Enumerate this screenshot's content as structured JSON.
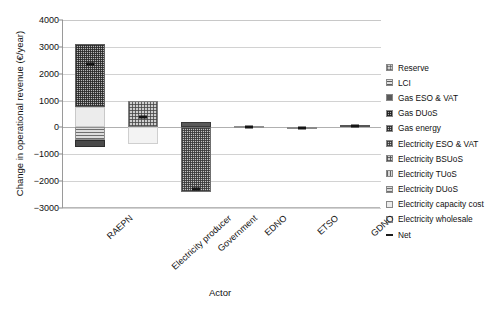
{
  "chart_data": {
    "type": "bar",
    "title": "",
    "xlabel": "Actor",
    "ylabel": "Change in operational revenue (€/year)",
    "ylim": [
      -3000,
      4000
    ],
    "ytick_step": 1000,
    "yticks": [
      "4000",
      "3000",
      "2000",
      "1000",
      "0",
      "−1000",
      "−2000",
      "−3000"
    ],
    "grid": true,
    "stacked": true,
    "legend_position": "right",
    "categories": [
      "RAEPN",
      "Electricity producer",
      "Government",
      "EDNO",
      "ETSO",
      "GDNO"
    ],
    "series": [
      {
        "name": "Reserve",
        "values": [
          0,
          0,
          0,
          0,
          0,
          0
        ]
      },
      {
        "name": "LCI",
        "values": [
          0,
          0,
          0,
          0,
          0,
          0
        ]
      },
      {
        "name": "Gas ESO & VAT",
        "values": [
          0,
          0,
          210,
          0,
          0,
          0
        ]
      },
      {
        "name": "Gas DUoS",
        "values": [
          0,
          0,
          0,
          0,
          0,
          60
        ]
      },
      {
        "name": "Gas energy",
        "values": [
          2350,
          0,
          0,
          0,
          0,
          0
        ]
      },
      {
        "name": "Electricity ESO & VAT",
        "values": [
          -250,
          0,
          -2400,
          0,
          0,
          0
        ]
      },
      {
        "name": "Electricity BSUoS",
        "values": [
          0,
          0,
          0,
          0,
          -20,
          0
        ]
      },
      {
        "name": "Electricity TUoS",
        "values": [
          0,
          0,
          0,
          0,
          0,
          0
        ]
      },
      {
        "name": "Electricity DUoS",
        "values": [
          -480,
          990,
          0,
          40,
          0,
          0
        ]
      },
      {
        "name": "Electricity capacity cost",
        "values": [
          750,
          0,
          0,
          0,
          0,
          0
        ]
      },
      {
        "name": "Electricity wholesale",
        "values": [
          0,
          -600,
          0,
          0,
          0,
          0
        ]
      },
      {
        "name": "Net",
        "values": [
          2380,
          370,
          -2280,
          30,
          -25,
          65
        ]
      }
    ],
    "net_marker_label": "Net",
    "bars": [
      {
        "category": "RAEPN",
        "positive_total": 3100,
        "negative_total": -730,
        "net": 2380,
        "segments": [
          {
            "series": "Electricity capacity cost",
            "from": 0,
            "to": 750,
            "pattern": "p-capacity"
          },
          {
            "series": "Gas energy",
            "from": 750,
            "to": 3100,
            "pattern": "p-gasenergy"
          },
          {
            "series": "Electricity DUoS",
            "from": 0,
            "to": -480,
            "pattern": "p-eduos"
          },
          {
            "series": "Electricity ESO & VAT",
            "from": -480,
            "to": -730,
            "pattern": "p-dark"
          }
        ]
      },
      {
        "category": "Electricity producer",
        "positive_total": 990,
        "negative_total": -600,
        "net": 370,
        "segments": [
          {
            "series": "Electricity DUoS",
            "from": 0,
            "to": 990,
            "pattern": "p-ebsuos"
          },
          {
            "series": "Electricity wholesale",
            "from": 0,
            "to": -600,
            "pattern": "p-wholesale"
          }
        ]
      },
      {
        "category": "Government",
        "positive_total": 210,
        "negative_total": -2400,
        "net": -2280,
        "segments": [
          {
            "series": "Gas ESO & VAT",
            "from": 0,
            "to": 210,
            "pattern": "p-gaseso"
          },
          {
            "series": "Electricity ESO & VAT",
            "from": 0,
            "to": -2400,
            "pattern": "p-eeso"
          }
        ]
      },
      {
        "category": "EDNO",
        "positive_total": 40,
        "negative_total": 0,
        "net": 30,
        "segments": [
          {
            "series": "Electricity DUoS",
            "from": 0,
            "to": 40,
            "pattern": "p-eduos"
          }
        ]
      },
      {
        "category": "ETSO",
        "positive_total": 0,
        "negative_total": -20,
        "net": -25,
        "segments": [
          {
            "series": "Electricity BSUoS",
            "from": 0,
            "to": -20,
            "pattern": "p-etuos"
          }
        ]
      },
      {
        "category": "GDNO",
        "positive_total": 95,
        "negative_total": 0,
        "net": 65,
        "segments": [
          {
            "series": "Gas DUoS",
            "from": 0,
            "to": 95,
            "pattern": "p-gasduos"
          }
        ]
      }
    ],
    "legend": [
      {
        "label": "Reserve",
        "pattern": "p-reserve"
      },
      {
        "label": "LCI",
        "pattern": "p-lci"
      },
      {
        "label": "Gas ESO & VAT",
        "pattern": "p-gaseso"
      },
      {
        "label": "Gas DUoS",
        "pattern": "p-gasduos"
      },
      {
        "label": "Gas energy",
        "pattern": "p-gasenergy"
      },
      {
        "label": "Electricity ESO & VAT",
        "pattern": "p-eeso"
      },
      {
        "label": "Electricity BSUoS",
        "pattern": "p-ebsuos"
      },
      {
        "label": "Electricity TUoS",
        "pattern": "p-etuos"
      },
      {
        "label": "Electricity DUoS",
        "pattern": "p-eduos"
      },
      {
        "label": "Electricity capacity cost",
        "pattern": "p-capacity"
      },
      {
        "label": "Electricity wholesale",
        "pattern": "p-wholesale"
      },
      {
        "label": "Net",
        "pattern": "netdash"
      }
    ]
  }
}
